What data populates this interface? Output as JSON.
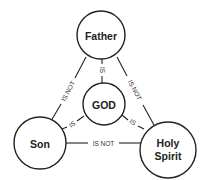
{
  "diagram": {
    "type": "shield-of-the-trinity",
    "colors": {
      "stroke": "#222222",
      "text": "#222222",
      "background": "#ffffff"
    },
    "nodes": {
      "father": {
        "label": "Father"
      },
      "god": {
        "label": "GOD"
      },
      "son": {
        "label": "Son"
      },
      "spirit": {
        "line1": "Holy",
        "line2": "Spirit"
      }
    },
    "edges": {
      "father_son": {
        "label": "IS NOT"
      },
      "father_spirit": {
        "label": "IS NOT"
      },
      "son_spirit": {
        "label": "IS NOT"
      },
      "father_god": {
        "label": "IS"
      },
      "son_god": {
        "label": "IS"
      },
      "spirit_god": {
        "label": "IS"
      }
    }
  }
}
